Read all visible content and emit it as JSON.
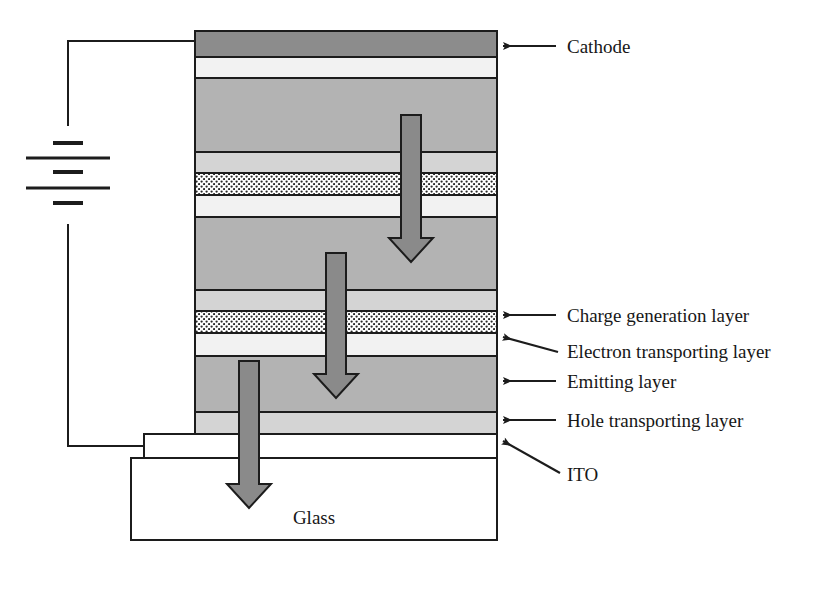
{
  "diagram": {
    "substrate": {
      "name": "Glass",
      "label": "Glass"
    },
    "callouts": [
      {
        "id": "cathode",
        "label": "Cathode",
        "target_layer": "cathode",
        "leader": "straight"
      },
      {
        "id": "cgl",
        "label": "Charge generation layer",
        "target_layer": "charge-generation",
        "leader": "straight"
      },
      {
        "id": "etl",
        "label": "Electron transporting layer",
        "target_layer": "electron-transport",
        "leader": "slanted"
      },
      {
        "id": "eml",
        "label": "Emitting layer",
        "target_layer": "emitting",
        "leader": "straight"
      },
      {
        "id": "htl",
        "label": "Hole transporting layer",
        "target_layer": "hole-transport",
        "leader": "straight"
      },
      {
        "id": "ito",
        "label": "ITO",
        "target_layer": "ito",
        "leader": "slanted"
      }
    ],
    "layers": [
      {
        "id": "cathode",
        "name": "Cathode",
        "y": 31,
        "h": 26,
        "fill": "#8c8c8c",
        "pattern": "solid"
      },
      {
        "id": "etl-3",
        "name": "Electron transporting layer",
        "y": 57,
        "h": 21,
        "fill": "#f2f2f2",
        "pattern": "solid"
      },
      {
        "id": "eml-3",
        "name": "Emitting layer",
        "y": 78,
        "h": 74,
        "fill": "#b3b3b3",
        "pattern": "solid"
      },
      {
        "id": "htl-3",
        "name": "Hole transporting layer",
        "y": 152,
        "h": 21,
        "fill": "#d4d4d4",
        "pattern": "solid"
      },
      {
        "id": "cgl-2",
        "name": "Charge generation layer",
        "y": 173,
        "h": 22,
        "fill": "#ffffff",
        "pattern": "dots"
      },
      {
        "id": "etl-2",
        "name": "Electron transporting layer",
        "y": 195,
        "h": 22,
        "fill": "#f2f2f2",
        "pattern": "solid"
      },
      {
        "id": "eml-2",
        "name": "Emitting layer",
        "y": 217,
        "h": 73,
        "fill": "#b3b3b3",
        "pattern": "solid"
      },
      {
        "id": "htl-2",
        "name": "Hole transporting layer",
        "y": 290,
        "h": 21,
        "fill": "#d4d4d4",
        "pattern": "solid"
      },
      {
        "id": "charge-generation",
        "name": "Charge generation layer",
        "y": 311,
        "h": 22,
        "fill": "#ffffff",
        "pattern": "dots"
      },
      {
        "id": "electron-transport",
        "name": "Electron transporting layer",
        "y": 333,
        "h": 23,
        "fill": "#f2f2f2",
        "pattern": "solid"
      },
      {
        "id": "emitting",
        "name": "Emitting layer",
        "y": 356,
        "h": 56,
        "fill": "#b3b3b3",
        "pattern": "solid"
      },
      {
        "id": "hole-transport",
        "name": "Hole transporting layer",
        "y": 412,
        "h": 22,
        "fill": "#d4d4d4",
        "pattern": "solid"
      },
      {
        "id": "ito",
        "name": "ITO",
        "y": 434,
        "h": 24,
        "fill": "#ffffff",
        "pattern": "solid"
      }
    ],
    "emission_arrows": [
      {
        "id": "arrow-top",
        "x": 411,
        "top": 115,
        "bottom": 262
      },
      {
        "id": "arrow-middle",
        "x": 336,
        "top": 253,
        "bottom": 398
      },
      {
        "id": "arrow-bottom",
        "x": 249,
        "top": 361,
        "bottom": 508
      }
    ],
    "power_source": {
      "name": "DC voltage source",
      "symbol": "battery"
    },
    "colors": {
      "cathode_fill": "#8c8c8c",
      "emitting_fill": "#b3b3b3",
      "hole_transport_fill": "#d4d4d4",
      "electron_transport_fill": "#f2f2f2",
      "charge_generation_fill": "#ffffff",
      "arrow_fill": "#8a8a8a",
      "outline": "#1c1c1c",
      "background": "#ffffff"
    }
  }
}
